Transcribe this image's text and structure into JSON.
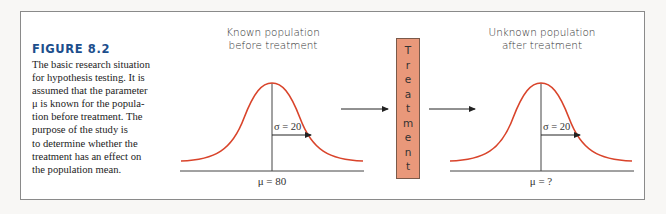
{
  "figure": {
    "title": "FIGURE 8.2",
    "caption_lines": [
      "The basic research situation",
      "for hypothesis testing. It is",
      "assumed that the parameter",
      "μ is known for the popula-",
      "tion before treatment. The",
      "purpose of the study is",
      "to determine whether the",
      "treatment has an effect on",
      "the population mean."
    ]
  },
  "left_population": {
    "label_line1": "Known population",
    "label_line2": "before treatment",
    "sigma_label": "σ = 20",
    "mu_label": "μ = 80"
  },
  "treatment": {
    "letters": [
      "T",
      "r",
      "e",
      "a",
      "t",
      "m",
      "e",
      "n",
      "t"
    ],
    "word": "Treatment"
  },
  "right_population": {
    "label_line1": "Unknown population",
    "label_line2": "after treatment",
    "sigma_label": "σ = 20",
    "mu_label": "μ = ?"
  },
  "colors": {
    "title": "#1c4e8c",
    "curve": "#d9442b",
    "treatment_box": "#e9987a",
    "frame": "#8a8a8a"
  }
}
